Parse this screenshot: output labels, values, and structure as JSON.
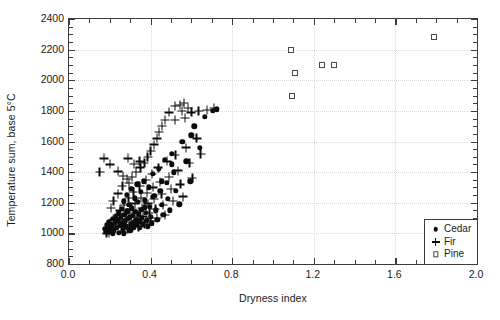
{
  "chart_data": {
    "type": "scatter",
    "title": "",
    "xlabel": "Dryness index",
    "ylabel": "Temperature sum, base 5°C",
    "xlim": [
      0.0,
      2.0
    ],
    "ylim": [
      800,
      2400
    ],
    "xticks": [
      "0.0",
      "0.4",
      "0.8",
      "1.2",
      "1.6",
      "2.0"
    ],
    "xtick_values": [
      0.0,
      0.4,
      0.8,
      1.2,
      1.6,
      2.0
    ],
    "xminor_step": 0.1,
    "yticks": [
      "800",
      "1000",
      "1200",
      "1400",
      "1600",
      "1800",
      "2000",
      "2200",
      "2400"
    ],
    "ytick_values": [
      800,
      1000,
      1200,
      1400,
      1600,
      1800,
      2000,
      2200,
      2400
    ],
    "yminor_step": 50,
    "grid": true,
    "legend_position": "bottom-right",
    "legend": [
      {
        "name": "Cedar",
        "marker": "filled-circle"
      },
      {
        "name": "Fir",
        "marker": "plus"
      },
      {
        "name": "Pine",
        "marker": "open-square"
      }
    ],
    "series": [
      {
        "name": "Cedar",
        "marker": "filled-circle",
        "color": "#0c0c0c",
        "points": [
          [
            0.175,
            1030
          ],
          [
            0.18,
            1010
          ],
          [
            0.185,
            1055
          ],
          [
            0.19,
            1040
          ],
          [
            0.195,
            1075
          ],
          [
            0.2,
            1025
          ],
          [
            0.205,
            1060
          ],
          [
            0.21,
            1045
          ],
          [
            0.215,
            1095
          ],
          [
            0.22,
            1015
          ],
          [
            0.225,
            1070
          ],
          [
            0.23,
            1110
          ],
          [
            0.235,
            1035
          ],
          [
            0.24,
            1085
          ],
          [
            0.245,
            1130
          ],
          [
            0.25,
            1050
          ],
          [
            0.255,
            1100
          ],
          [
            0.258,
            1160
          ],
          [
            0.262,
            1065
          ],
          [
            0.265,
            1020
          ],
          [
            0.268,
            1210
          ],
          [
            0.272,
            1120
          ],
          [
            0.275,
            1080
          ],
          [
            0.278,
            1045
          ],
          [
            0.282,
            1250
          ],
          [
            0.285,
            1145
          ],
          [
            0.288,
            1095
          ],
          [
            0.292,
            1030
          ],
          [
            0.295,
            1185
          ],
          [
            0.298,
            1105
          ],
          [
            0.302,
            1060
          ],
          [
            0.305,
            1290
          ],
          [
            0.308,
            1165
          ],
          [
            0.312,
            1115
          ],
          [
            0.315,
            1070
          ],
          [
            0.318,
            1040
          ],
          [
            0.322,
            1230
          ],
          [
            0.325,
            1140
          ],
          [
            0.328,
            1090
          ],
          [
            0.332,
            1055
          ],
          [
            0.335,
            1320
          ],
          [
            0.338,
            1205
          ],
          [
            0.342,
            1125
          ],
          [
            0.345,
            1075
          ],
          [
            0.348,
            1035
          ],
          [
            0.352,
            1270
          ],
          [
            0.355,
            1155
          ],
          [
            0.358,
            1100
          ],
          [
            0.362,
            1060
          ],
          [
            0.368,
            1340
          ],
          [
            0.372,
            1215
          ],
          [
            0.375,
            1135
          ],
          [
            0.38,
            1085
          ],
          [
            0.385,
            1045
          ],
          [
            0.39,
            1300
          ],
          [
            0.395,
            1175
          ],
          [
            0.4,
            1110
          ],
          [
            0.405,
            1065
          ],
          [
            0.412,
            1390
          ],
          [
            0.418,
            1245
          ],
          [
            0.425,
            1150
          ],
          [
            0.432,
            1090
          ],
          [
            0.44,
            1420
          ],
          [
            0.448,
            1280
          ],
          [
            0.455,
            1185
          ],
          [
            0.462,
            1120
          ],
          [
            0.47,
            1480
          ],
          [
            0.478,
            1330
          ],
          [
            0.485,
            1225
          ],
          [
            0.495,
            1150
          ],
          [
            0.505,
            1520
          ],
          [
            0.515,
            1400
          ],
          [
            0.525,
            1280
          ],
          [
            0.54,
            1190
          ],
          [
            0.555,
            1600
          ],
          [
            0.575,
            1470
          ],
          [
            0.595,
            1340
          ],
          [
            0.615,
            1700
          ],
          [
            0.64,
            1560
          ],
          [
            0.665,
            1760
          ],
          [
            0.705,
            1800
          ],
          [
            0.725,
            1810
          ],
          [
            0.6,
            1640
          ],
          [
            0.505,
            1450
          ],
          [
            0.455,
            1340
          ],
          [
            0.412,
            1240
          ],
          [
            0.372,
            1170
          ],
          [
            0.335,
            1085
          ],
          [
            0.3,
            1020
          ],
          [
            0.27,
            1000
          ],
          [
            0.245,
            1005
          ],
          [
            0.215,
            1000
          ]
        ]
      },
      {
        "name": "Fir",
        "marker": "plus",
        "color": "#0c0c0c",
        "points": [
          [
            0.19,
            1020
          ],
          [
            0.2,
            1060
          ],
          [
            0.21,
            1035
          ],
          [
            0.22,
            1090
          ],
          [
            0.228,
            1050
          ],
          [
            0.235,
            1120
          ],
          [
            0.242,
            1070
          ],
          [
            0.25,
            1150
          ],
          [
            0.256,
            1095
          ],
          [
            0.262,
            1045
          ],
          [
            0.268,
            1185
          ],
          [
            0.274,
            1125
          ],
          [
            0.28,
            1075
          ],
          [
            0.286,
            1030
          ],
          [
            0.292,
            1230
          ],
          [
            0.298,
            1160
          ],
          [
            0.304,
            1105
          ],
          [
            0.31,
            1055
          ],
          [
            0.316,
            1270
          ],
          [
            0.322,
            1195
          ],
          [
            0.328,
            1135
          ],
          [
            0.334,
            1085
          ],
          [
            0.34,
            1040
          ],
          [
            0.346,
            1310
          ],
          [
            0.352,
            1230
          ],
          [
            0.358,
            1165
          ],
          [
            0.364,
            1110
          ],
          [
            0.37,
            1060
          ],
          [
            0.376,
            1350
          ],
          [
            0.382,
            1265
          ],
          [
            0.388,
            1195
          ],
          [
            0.394,
            1135
          ],
          [
            0.4,
            1080
          ],
          [
            0.406,
            1390
          ],
          [
            0.412,
            1300
          ],
          [
            0.418,
            1225
          ],
          [
            0.424,
            1160
          ],
          [
            0.43,
            1100
          ],
          [
            0.438,
            1430
          ],
          [
            0.446,
            1335
          ],
          [
            0.454,
            1255
          ],
          [
            0.462,
            1185
          ],
          [
            0.47,
            1120
          ],
          [
            0.48,
            1470
          ],
          [
            0.49,
            1370
          ],
          [
            0.5,
            1290
          ],
          [
            0.51,
            1210
          ],
          [
            0.522,
            1510
          ],
          [
            0.534,
            1410
          ],
          [
            0.546,
            1320
          ],
          [
            0.56,
            1240
          ],
          [
            0.575,
            1560
          ],
          [
            0.59,
            1460
          ],
          [
            0.605,
            1360
          ],
          [
            0.625,
            1620
          ],
          [
            0.645,
            1520
          ],
          [
            0.52,
            1830
          ],
          [
            0.545,
            1840
          ],
          [
            0.555,
            1800
          ],
          [
            0.565,
            1850
          ],
          [
            0.57,
            1755
          ],
          [
            0.585,
            1820
          ],
          [
            0.49,
            1790
          ],
          [
            0.47,
            1740
          ],
          [
            0.455,
            1700
          ],
          [
            0.44,
            1660
          ],
          [
            0.43,
            1620
          ],
          [
            0.415,
            1580
          ],
          [
            0.4,
            1540
          ],
          [
            0.385,
            1500
          ],
          [
            0.37,
            1460
          ],
          [
            0.35,
            1430
          ],
          [
            0.33,
            1400
          ],
          [
            0.31,
            1370
          ],
          [
            0.295,
            1330
          ],
          [
            0.15,
            1400
          ],
          [
            0.172,
            1490
          ],
          [
            0.2,
            1450
          ],
          [
            0.24,
            1405
          ],
          [
            0.265,
            1375
          ],
          [
            0.29,
            1490
          ],
          [
            0.318,
            1455
          ],
          [
            0.346,
            1470
          ],
          [
            0.52,
            1740
          ],
          [
            0.6,
            1790
          ],
          [
            0.635,
            1800
          ],
          [
            0.675,
            1805
          ],
          [
            0.71,
            1820
          ],
          [
            0.218,
            1210
          ],
          [
            0.24,
            1260
          ],
          [
            0.262,
            1310
          ],
          [
            0.285,
            1355
          ],
          [
            0.205,
            1165
          ],
          [
            0.228,
            1100
          ],
          [
            0.196,
            1005
          ],
          [
            0.184,
            1000
          ]
        ]
      },
      {
        "name": "Pine",
        "marker": "open-square",
        "color": "#4a4a4a",
        "points": [
          [
            1.09,
            2195
          ],
          [
            1.095,
            1900
          ],
          [
            1.11,
            2045
          ],
          [
            1.24,
            2100
          ],
          [
            1.3,
            2100
          ],
          [
            1.79,
            2280
          ]
        ]
      }
    ]
  }
}
